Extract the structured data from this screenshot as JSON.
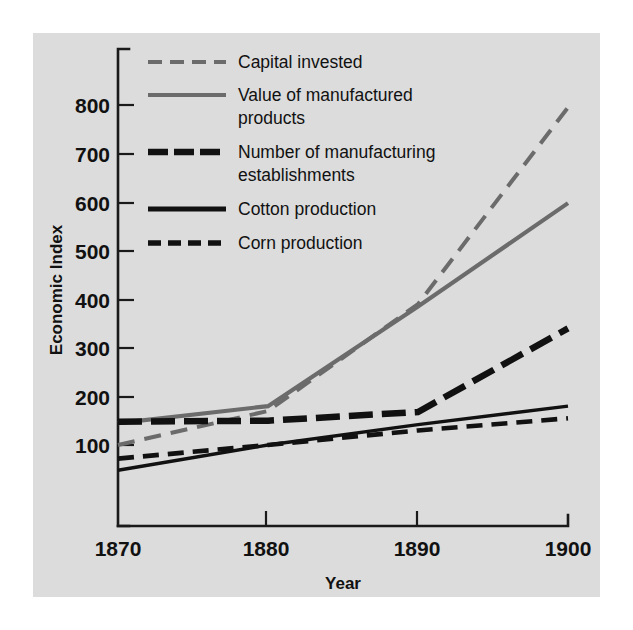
{
  "figure": {
    "background": "#dcdcdc",
    "page_background": "#ffffff"
  },
  "axes": {
    "x_title": "Year",
    "y_title": "Economic Index",
    "x_ticks": [
      "1870",
      "1880",
      "1890",
      "1900"
    ],
    "y_ticks": [
      "800",
      "700",
      "600",
      "500",
      "400",
      "300",
      "200",
      "100"
    ]
  },
  "legend": {
    "items": [
      {
        "label": "Capital invested",
        "key": "capital_invested",
        "color": "#6b6b6b",
        "style": "dashed"
      },
      {
        "label": "Value of manufactured products",
        "key": "value_manufactured",
        "color": "#6b6b6b",
        "style": "solid"
      },
      {
        "label": "Number of manufacturing establishments",
        "key": "num_establishments",
        "color": "#111111",
        "style": "dashed-thick"
      },
      {
        "label": "Cotton production",
        "key": "cotton_production",
        "color": "#111111",
        "style": "solid-thin"
      },
      {
        "label": "Corn production",
        "key": "corn_production",
        "color": "#111111",
        "style": "dashed-medium"
      }
    ]
  },
  "chart_data": {
    "type": "line",
    "title": "",
    "xlabel": "Year",
    "ylabel": "Economic Index",
    "x": [
      1870,
      1880,
      1890,
      1900
    ],
    "xlim": [
      1870,
      1900
    ],
    "ylim": [
      0,
      880
    ],
    "grid": false,
    "legend_position": "top-left-inside",
    "series": [
      {
        "name": "Capital invested",
        "color": "#6b6b6b",
        "style": "dashed",
        "values": [
          100,
          170,
          390,
          795
        ]
      },
      {
        "name": "Value of manufactured products",
        "color": "#6b6b6b",
        "style": "solid",
        "values": [
          145,
          180,
          385,
          598
        ]
      },
      {
        "name": "Number of manufacturing establishments",
        "color": "#111111",
        "style": "dashed-thick",
        "values": [
          148,
          150,
          168,
          340
        ]
      },
      {
        "name": "Cotton production",
        "color": "#111111",
        "style": "solid-thin",
        "values": [
          48,
          100,
          142,
          180
        ]
      },
      {
        "name": "Corn production",
        "color": "#111111",
        "style": "dashed-medium",
        "values": [
          72,
          100,
          130,
          155
        ]
      }
    ]
  }
}
